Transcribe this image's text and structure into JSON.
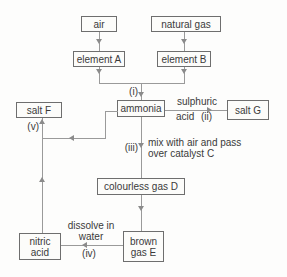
{
  "boxes": {
    "air": "air",
    "natural_gas": "natural gas",
    "element_a": "element A",
    "element_b": "element B",
    "ammonia": "ammonia",
    "salt_f": "salt F",
    "salt_g": "salt G",
    "colourless_gas_d": "colourless gas D",
    "nitric_acid": "nitric acid",
    "brown_gas_e": "brown gas E"
  },
  "edge_labels": {
    "i": "(i)",
    "ii": "(ii)",
    "iii": "(iii)",
    "iv": "(iv)",
    "v": "(v)",
    "sulphuric": "sulphuric",
    "acid": "acid",
    "mix_line1": "mix with air and pass",
    "mix_line2": "over catalyst C",
    "dissolve_line1": "dissolve in",
    "dissolve_line2": "water"
  },
  "connections": [
    {
      "from": "air",
      "to": "element A",
      "label": ""
    },
    {
      "from": "natural gas",
      "to": "element B",
      "label": ""
    },
    {
      "from": "element A",
      "to": "ammonia",
      "label": "(i)"
    },
    {
      "from": "element B",
      "to": "ammonia",
      "label": "(i)"
    },
    {
      "from": "ammonia",
      "to": "salt G",
      "label": "sulphuric acid (ii)"
    },
    {
      "from": "ammonia",
      "to": "colourless gas D",
      "label": "(iii) mix with air and pass over catalyst C"
    },
    {
      "from": "colourless gas D",
      "to": "brown gas E",
      "label": ""
    },
    {
      "from": "brown gas E",
      "to": "nitric acid",
      "label": "dissolve in water (iv)"
    },
    {
      "from": "nitric acid",
      "to": "salt F",
      "label": "(v)"
    },
    {
      "from": "ammonia",
      "to": "salt F",
      "label": "(v)"
    }
  ],
  "colors": {
    "background": "#fdfdfc",
    "box_fill": "#fcfcfa",
    "box_border": "#6e6e6e",
    "line": "#9a9a9a",
    "text": "#3a3a3a"
  }
}
